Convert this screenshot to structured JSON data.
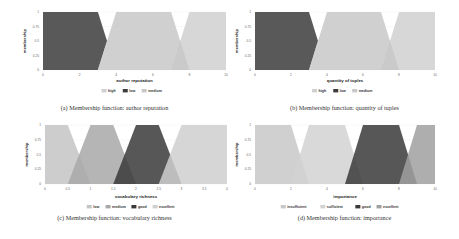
{
  "chart_data": [
    {
      "type": "area",
      "title": "",
      "caption": "(a) Membership function: author reputation",
      "xlabel": "author reputation",
      "ylabel": "membership",
      "xlim": [
        0,
        10
      ],
      "ylim": [
        0,
        1
      ],
      "xticks": [
        "0",
        "2",
        "4",
        "6",
        "8",
        "10"
      ],
      "yticks": [
        "0",
        "0.25",
        "0.5",
        "0.75",
        "1"
      ],
      "legend": [
        "high",
        "low",
        "medium"
      ],
      "legend_position": "bottom",
      "series": [
        {
          "name": "high",
          "color": "#d0d0d0",
          "points": [
            [
              7,
              0
            ],
            [
              8,
              1
            ],
            [
              10,
              1
            ],
            [
              10,
              0
            ]
          ]
        },
        {
          "name": "low",
          "color": "#3c3c3c",
          "points": [
            [
              0,
              0
            ],
            [
              0,
              1
            ],
            [
              3,
              1
            ],
            [
              3.5,
              0.5
            ],
            [
              3,
              0
            ]
          ]
        },
        {
          "name": "medium",
          "color": "#c8c8c8",
          "points": [
            [
              3,
              0
            ],
            [
              4,
              1
            ],
            [
              7,
              1
            ],
            [
              8,
              0
            ]
          ]
        }
      ]
    },
    {
      "type": "area",
      "title": "",
      "caption": "(b) Membership function: quantity of tuples",
      "xlabel": "quantity of tuples",
      "ylabel": "membership",
      "xlim": [
        0,
        10
      ],
      "ylim": [
        0,
        1
      ],
      "xticks": [
        "0",
        "2",
        "4",
        "6",
        "8",
        "10"
      ],
      "yticks": [
        "0",
        "0.25",
        "0.5",
        "0.75",
        "1"
      ],
      "legend": [
        "high",
        "low",
        "medium"
      ],
      "legend_position": "bottom",
      "series": [
        {
          "name": "high",
          "color": "#d0d0d0",
          "points": [
            [
              7,
              0
            ],
            [
              8,
              1
            ],
            [
              10,
              1
            ],
            [
              10,
              0
            ]
          ]
        },
        {
          "name": "low",
          "color": "#3c3c3c",
          "points": [
            [
              0,
              0
            ],
            [
              0,
              1
            ],
            [
              3,
              1
            ],
            [
              3.5,
              0.5
            ],
            [
              3,
              0
            ]
          ]
        },
        {
          "name": "medium",
          "color": "#c8c8c8",
          "points": [
            [
              3,
              0
            ],
            [
              4,
              1
            ],
            [
              7,
              1
            ],
            [
              8,
              0
            ]
          ]
        }
      ]
    },
    {
      "type": "area",
      "title": "",
      "caption": "(c) Membership function: vocabulary richness",
      "xlabel": "vocabulary richness",
      "ylabel": "membership",
      "xlim": [
        0,
        4
      ],
      "ylim": [
        0,
        1
      ],
      "xticks": [
        "0",
        "0.5",
        "1",
        "1.5",
        "2",
        "2.5",
        "3",
        "3.5",
        "4"
      ],
      "yticks": [
        "0",
        "0.25",
        "0.5",
        "0.75",
        "1"
      ],
      "legend": [
        "low",
        "medium",
        "good",
        "excellent"
      ],
      "legend_position": "bottom",
      "series": [
        {
          "name": "low",
          "color": "#c4c4c4",
          "points": [
            [
              0,
              0
            ],
            [
              0,
              1
            ],
            [
              0.5,
              1
            ],
            [
              1,
              0
            ]
          ]
        },
        {
          "name": "medium",
          "color": "#a8a8a8",
          "points": [
            [
              0.5,
              0
            ],
            [
              1,
              1
            ],
            [
              1.5,
              1
            ],
            [
              2,
              0
            ]
          ]
        },
        {
          "name": "good",
          "color": "#3a3a3a",
          "points": [
            [
              1.5,
              0
            ],
            [
              2,
              1
            ],
            [
              2.5,
              1
            ],
            [
              3,
              0
            ]
          ]
        },
        {
          "name": "excellent",
          "color": "#cfcfcf",
          "points": [
            [
              2.5,
              0
            ],
            [
              3,
              1
            ],
            [
              4,
              1
            ],
            [
              4,
              0
            ]
          ]
        }
      ]
    },
    {
      "type": "area",
      "title": "",
      "caption": "(d) Membership function: importance",
      "xlabel": "importance",
      "ylabel": "membership",
      "xlim": [
        0,
        10
      ],
      "ylim": [
        0,
        1
      ],
      "xticks": [
        "0",
        "2",
        "4",
        "6",
        "8",
        "10"
      ],
      "yticks": [
        "0",
        "0.25",
        "0.5",
        "0.75",
        "1"
      ],
      "legend": [
        "insufficient",
        "sufficient",
        "good",
        "excellent"
      ],
      "legend_position": "bottom",
      "series": [
        {
          "name": "insufficient",
          "color": "#c8c8c8",
          "points": [
            [
              0,
              0
            ],
            [
              0,
              1
            ],
            [
              2,
              1
            ],
            [
              3,
              0
            ]
          ]
        },
        {
          "name": "sufficient",
          "color": "#d2d2d2",
          "points": [
            [
              2,
              0
            ],
            [
              3,
              1
            ],
            [
              5,
              1
            ],
            [
              6,
              0
            ]
          ]
        },
        {
          "name": "good",
          "color": "#3a3a3a",
          "points": [
            [
              5,
              0
            ],
            [
              6,
              1
            ],
            [
              8,
              1
            ],
            [
              9,
              0
            ]
          ]
        },
        {
          "name": "excellent",
          "color": "#a0a0a0",
          "points": [
            [
              8,
              0
            ],
            [
              9,
              1
            ],
            [
              10,
              1
            ],
            [
              10,
              0
            ]
          ]
        }
      ]
    }
  ]
}
